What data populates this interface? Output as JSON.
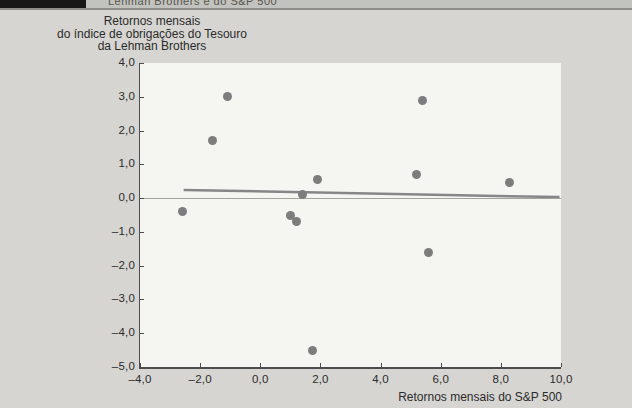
{
  "header": {
    "fragment": "Lehman Brothers e do S&P 500"
  },
  "chart_data": {
    "type": "scatter",
    "title": "",
    "ylabel_lines": [
      "Retornos mensais",
      "do índice de obrigações do Tesouro",
      "da Lehman Brothers"
    ],
    "xlabel": "Retornos mensais do S&P 500",
    "xlim": [
      -4,
      10
    ],
    "ylim": [
      -5,
      4
    ],
    "grid": false,
    "legend": null,
    "x_ticks": [
      {
        "v": -4,
        "label": "–4,0"
      },
      {
        "v": -2,
        "label": "–2,0"
      },
      {
        "v": 0,
        "label": "0,0"
      },
      {
        "v": 2,
        "label": "2,0"
      },
      {
        "v": 4,
        "label": "4,0"
      },
      {
        "v": 6,
        "label": "6,0"
      },
      {
        "v": 8,
        "label": "8,0"
      },
      {
        "v": 10,
        "label": "10,0"
      }
    ],
    "y_ticks": [
      {
        "v": 4,
        "label": "4,0"
      },
      {
        "v": 3,
        "label": "3,0"
      },
      {
        "v": 2,
        "label": "2,0"
      },
      {
        "v": 1,
        "label": "1,0"
      },
      {
        "v": 0,
        "label": "0,0"
      },
      {
        "v": -1,
        "label": "–1,0"
      },
      {
        "v": -2,
        "label": "–2,0"
      },
      {
        "v": -3,
        "label": "–3,0"
      },
      {
        "v": -4,
        "label": "–4,0"
      },
      {
        "v": -5,
        "label": "–5,0"
      }
    ],
    "points": [
      {
        "x": -2.6,
        "y": -0.4
      },
      {
        "x": -1.6,
        "y": 1.7
      },
      {
        "x": -1.1,
        "y": 3.0
      },
      {
        "x": 1.0,
        "y": -0.5
      },
      {
        "x": 1.2,
        "y": -0.7
      },
      {
        "x": 1.4,
        "y": 0.1
      },
      {
        "x": 1.9,
        "y": 0.55
      },
      {
        "x": 1.75,
        "y": -4.5
      },
      {
        "x": 5.2,
        "y": 0.7
      },
      {
        "x": 5.4,
        "y": 2.9
      },
      {
        "x": 5.6,
        "y": -1.6
      },
      {
        "x": 8.3,
        "y": 0.45
      }
    ],
    "trendline": {
      "x1": -2.55,
      "y1": 0.24,
      "x2": 9.95,
      "y2": 0.03
    },
    "zero_line_y": 0
  },
  "colors": {
    "page_bg": "#d6d5d1",
    "plot_bg": "#f5f5f2",
    "point": "#7d7d7d",
    "trend": "#868686",
    "axis": "#4c4c4c",
    "zero_line": "#a2a29e",
    "text": "#2b2b2b",
    "header_box": "#171717",
    "header_strip": "#c2c2be",
    "header_rule": "#8d8d89"
  }
}
